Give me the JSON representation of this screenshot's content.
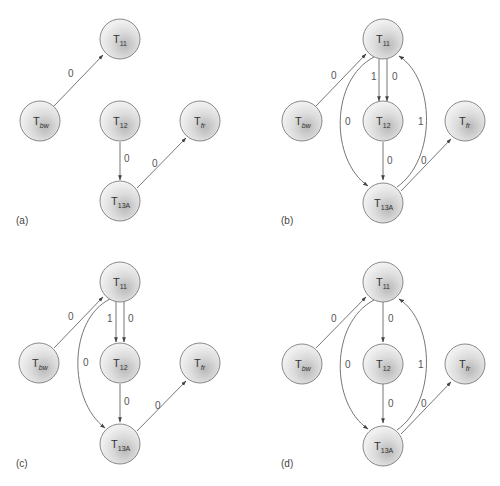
{
  "colors": {
    "node_fill_light": "#f2f2f2",
    "node_fill_dark": "#b8b8b8",
    "node_stroke": "#6e6e6e",
    "edge": "#555555",
    "text": "#333333"
  },
  "nodes": {
    "T11": {
      "base": "T",
      "sub": "11",
      "sub_italic": false
    },
    "Tbw": {
      "base": "T",
      "sub": "bw",
      "sub_italic": true
    },
    "T12": {
      "base": "T",
      "sub": "12",
      "sub_italic": false
    },
    "Tfr": {
      "base": "T",
      "sub": "fr",
      "sub_italic": true
    },
    "T13A": {
      "base": "T",
      "sub": "13A",
      "sub_italic": false
    }
  },
  "panels": [
    {
      "label": "(a)",
      "edges": [
        {
          "from": "Tbw",
          "to": "T11",
          "weight": "0"
        },
        {
          "from": "T12",
          "to": "T13A",
          "weight": "0"
        },
        {
          "from": "T13A",
          "to": "Tfr",
          "weight": "0"
        }
      ]
    },
    {
      "label": "(b)",
      "edges": [
        {
          "from": "Tbw",
          "to": "T11",
          "weight": "0"
        },
        {
          "from": "T11",
          "to": "T12",
          "weight": "1"
        },
        {
          "from": "T11",
          "to": "T12",
          "weight": "0"
        },
        {
          "from": "T11",
          "to": "T13A",
          "weight": "0",
          "curved": "left"
        },
        {
          "from": "T13A",
          "to": "T11",
          "weight": "1",
          "curved": "right"
        },
        {
          "from": "T12",
          "to": "T13A",
          "weight": "0"
        },
        {
          "from": "T13A",
          "to": "Tfr",
          "weight": "0"
        }
      ]
    },
    {
      "label": "(c)",
      "edges": [
        {
          "from": "Tbw",
          "to": "T11",
          "weight": "0"
        },
        {
          "from": "T11",
          "to": "T12",
          "weight": "1"
        },
        {
          "from": "T11",
          "to": "T12",
          "weight": "0"
        },
        {
          "from": "T11",
          "to": "T13A",
          "weight": "0",
          "curved": "left"
        },
        {
          "from": "T12",
          "to": "T13A",
          "weight": "0"
        },
        {
          "from": "T13A",
          "to": "Tfr",
          "weight": "0"
        }
      ]
    },
    {
      "label": "(d)",
      "edges": [
        {
          "from": "Tbw",
          "to": "T11",
          "weight": "0"
        },
        {
          "from": "T11",
          "to": "T12",
          "weight": "0"
        },
        {
          "from": "T11",
          "to": "T13A",
          "weight": "0",
          "curved": "left"
        },
        {
          "from": "T13A",
          "to": "T11",
          "weight": "1",
          "curved": "right"
        },
        {
          "from": "T12",
          "to": "T13A",
          "weight": "0"
        },
        {
          "from": "T13A",
          "to": "Tfr",
          "weight": "0"
        }
      ]
    }
  ]
}
